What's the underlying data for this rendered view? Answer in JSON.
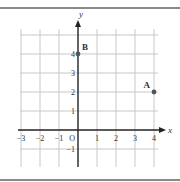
{
  "figure": {
    "type": "coordinate-plane",
    "axes": {
      "x_label": "x",
      "y_label": "y",
      "origin_label": "O",
      "x_ticks": [
        {
          "value": -3,
          "label": "−3"
        },
        {
          "value": -2,
          "label": "−2"
        },
        {
          "value": -1,
          "label": "−1"
        },
        {
          "value": 1,
          "label": "1"
        },
        {
          "value": 2,
          "label": "2"
        },
        {
          "value": 3,
          "label": "3"
        },
        {
          "value": 4,
          "label": "4"
        }
      ],
      "y_ticks": [
        {
          "value": -1,
          "label": "−1"
        },
        {
          "value": 1,
          "label": "1"
        },
        {
          "value": 2,
          "label": "2"
        },
        {
          "value": 3,
          "label": "3"
        },
        {
          "value": 4,
          "label": "4"
        }
      ],
      "x_range": [
        -3,
        4
      ],
      "y_range": [
        -1.9,
        5
      ]
    },
    "points": [
      {
        "label": "A",
        "x": 4,
        "y": 2
      },
      {
        "label": "B",
        "x": 0,
        "y": 4
      }
    ],
    "colors": {
      "grid": "#c8c8c8",
      "axis": "#222222",
      "point": "#555555",
      "border": "#777777",
      "text": "#333333"
    }
  }
}
